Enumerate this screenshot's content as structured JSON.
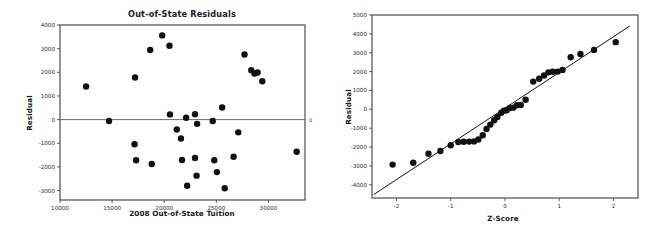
{
  "page": {
    "background": "#ffffff",
    "width": 656,
    "height": 236
  },
  "charts": [
    {
      "id": "out-of-state-residuals-scatter",
      "title": "Out-of-State Residuals",
      "xlabel": "2008 Out-of-State Tuition",
      "ylabel": "Residual",
      "zero_line_label": "0"
    },
    {
      "id": "normal-probability-plot",
      "title": "",
      "xlabel": "Z-Score",
      "ylabel": "Residual"
    }
  ],
  "chart_data": [
    {
      "type": "scatter",
      "title": "Out-of-State Residuals",
      "xlabel": "2008 Out-of-State Tuition",
      "ylabel": "Residual",
      "xlim": [
        10000,
        33500
      ],
      "ylim": [
        -3400,
        4000
      ],
      "xticks": [
        10000,
        15000,
        20000,
        25000,
        30000
      ],
      "yticks": [
        -3000,
        -2000,
        -1000,
        0,
        1000,
        2000,
        3000,
        4000
      ],
      "grid": false,
      "legend": null,
      "reference_line": {
        "type": "horizontal",
        "y": 0,
        "label": "0"
      },
      "marker": {
        "shape": "circle",
        "color": "#111111",
        "size": 3.2
      },
      "points": [
        {
          "x": 12500,
          "y": 1400
        },
        {
          "x": 14700,
          "y": -60
        },
        {
          "x": 17150,
          "y": -1040
        },
        {
          "x": 17200,
          "y": 1780
        },
        {
          "x": 17300,
          "y": -1720
        },
        {
          "x": 18650,
          "y": 2940
        },
        {
          "x": 18800,
          "y": -1880
        },
        {
          "x": 19800,
          "y": 3560
        },
        {
          "x": 20500,
          "y": 3120
        },
        {
          "x": 20550,
          "y": 220
        },
        {
          "x": 21200,
          "y": -420
        },
        {
          "x": 21600,
          "y": -800
        },
        {
          "x": 21700,
          "y": -1710
        },
        {
          "x": 22100,
          "y": 80
        },
        {
          "x": 22200,
          "y": -2800
        },
        {
          "x": 22950,
          "y": 230
        },
        {
          "x": 22950,
          "y": -1620
        },
        {
          "x": 23150,
          "y": -180
        },
        {
          "x": 23100,
          "y": -2370
        },
        {
          "x": 24650,
          "y": -60
        },
        {
          "x": 24800,
          "y": -1720
        },
        {
          "x": 25050,
          "y": -2220
        },
        {
          "x": 25550,
          "y": 510
        },
        {
          "x": 25800,
          "y": -2900
        },
        {
          "x": 26650,
          "y": -1570
        },
        {
          "x": 27100,
          "y": -540
        },
        {
          "x": 27700,
          "y": 2750
        },
        {
          "x": 28350,
          "y": 2090
        },
        {
          "x": 28650,
          "y": 1950
        },
        {
          "x": 28950,
          "y": 1990
        },
        {
          "x": 29400,
          "y": 1620
        },
        {
          "x": 32700,
          "y": -1360
        }
      ]
    },
    {
      "type": "scatter",
      "title": "",
      "xlabel": "Z-Score",
      "ylabel": "Residual",
      "xlim": [
        -2.45,
        2.45
      ],
      "ylim": [
        -4700,
        5000
      ],
      "xticks": [
        -2,
        -1,
        0,
        1,
        2
      ],
      "yticks": [
        -4000,
        -3000,
        -2000,
        -1000,
        0,
        1000,
        2000,
        3000,
        4000,
        5000
      ],
      "grid": false,
      "legend": null,
      "fit_line": {
        "type": "linear",
        "x0": -2.42,
        "y0": -4520,
        "x1": 2.3,
        "y1": 4420
      },
      "marker": {
        "shape": "circle",
        "color": "#111111",
        "size": 3.2
      },
      "points": [
        {
          "x": -2.07,
          "y": -2930
        },
        {
          "x": -1.69,
          "y": -2830
        },
        {
          "x": -1.41,
          "y": -2350
        },
        {
          "x": -1.19,
          "y": -2210
        },
        {
          "x": -1.0,
          "y": -1900
        },
        {
          "x": -0.86,
          "y": -1730
        },
        {
          "x": -0.76,
          "y": -1720
        },
        {
          "x": -0.66,
          "y": -1710
        },
        {
          "x": -0.57,
          "y": -1700
        },
        {
          "x": -0.49,
          "y": -1600
        },
        {
          "x": -0.41,
          "y": -1370
        },
        {
          "x": -0.34,
          "y": -1040
        },
        {
          "x": -0.27,
          "y": -810
        },
        {
          "x": -0.2,
          "y": -580
        },
        {
          "x": -0.14,
          "y": -410
        },
        {
          "x": -0.07,
          "y": -180
        },
        {
          "x": -0.02,
          "y": -70
        },
        {
          "x": 0.03,
          "y": -50
        },
        {
          "x": 0.09,
          "y": 70
        },
        {
          "x": 0.15,
          "y": 90
        },
        {
          "x": 0.22,
          "y": 220
        },
        {
          "x": 0.29,
          "y": 230
        },
        {
          "x": 0.38,
          "y": 510
        },
        {
          "x": 0.52,
          "y": 1470
        },
        {
          "x": 0.63,
          "y": 1620
        },
        {
          "x": 0.72,
          "y": 1790
        },
        {
          "x": 0.8,
          "y": 1960
        },
        {
          "x": 0.88,
          "y": 1990
        },
        {
          "x": 0.97,
          "y": 2000
        },
        {
          "x": 1.06,
          "y": 2090
        },
        {
          "x": 1.21,
          "y": 2760
        },
        {
          "x": 1.39,
          "y": 2930
        },
        {
          "x": 1.64,
          "y": 3150
        },
        {
          "x": 2.04,
          "y": 3560
        }
      ]
    }
  ]
}
